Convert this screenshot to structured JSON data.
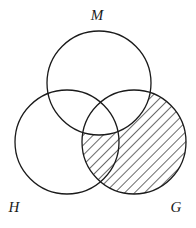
{
  "diagram": {
    "type": "venn",
    "sets": [
      {
        "id": "M",
        "label": "M",
        "cx": 99,
        "cy": 83,
        "r": 52,
        "label_x": 97,
        "label_y": 20
      },
      {
        "id": "H",
        "label": "H",
        "cx": 67,
        "cy": 142,
        "r": 52,
        "label_x": 14,
        "label_y": 212
      },
      {
        "id": "G",
        "label": "G",
        "cx": 134,
        "cy": 142,
        "r": 52,
        "label_x": 176,
        "label_y": 212
      }
    ],
    "shaded_region": "G \\ M",
    "shading": "diagonal-hatch",
    "colors": {
      "stroke": "#1a1a1a",
      "background": "#ffffff",
      "hatch": "#1a1a1a"
    }
  }
}
